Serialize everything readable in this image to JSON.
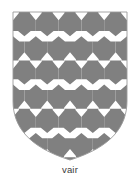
{
  "figure": {
    "title": "vair",
    "caption": "vair"
  },
  "caption": {
    "text": "vair"
  },
  "shield": {
    "outline_color": "#9a9a9a",
    "field_color": "#ffffff",
    "tincture_color": "#808080",
    "left": 13,
    "right": 127,
    "top": 12,
    "point_y": 160,
    "width": 114,
    "height": 148
  },
  "pattern": {
    "name": "vair",
    "type": "heraldic-fur",
    "gray": "#808080",
    "white": "#ffffff",
    "columns": 5,
    "rows": 6,
    "cell_width": 22.8,
    "row_height": 24.2
  }
}
